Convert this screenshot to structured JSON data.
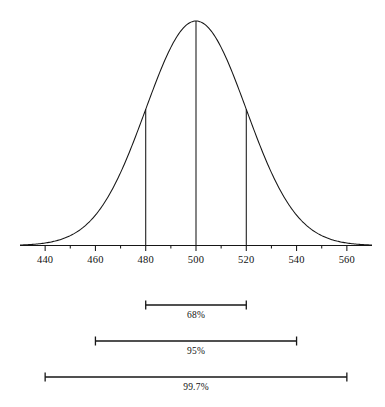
{
  "figure": {
    "name": "normal-distribution-empirical-rule",
    "caption_partial": ""
  },
  "chart_data": {
    "type": "line",
    "title": "",
    "subtitle": "",
    "xlabel": "",
    "ylabel": "",
    "grid": false,
    "legend": null,
    "xlim": [
      430,
      570
    ],
    "x_tick_labels": [
      "440",
      "460",
      "480",
      "500",
      "520",
      "540",
      "560"
    ],
    "x_tick_values": [
      440,
      460,
      480,
      500,
      520,
      540,
      560
    ],
    "minor_tick_step": 10,
    "distribution": {
      "shape": "normal",
      "mean": 500,
      "std_dev": 20,
      "peak_x": 500
    },
    "vertical_markers": [
      {
        "x": 480,
        "label": "480",
        "height_fraction": 0.6065
      },
      {
        "x": 500,
        "label": "500",
        "height_fraction": 1.0
      },
      {
        "x": 520,
        "label": "520",
        "height_fraction": 0.6065
      }
    ],
    "series": [
      {
        "name": "normal density",
        "x": [
          430,
          435,
          440,
          445,
          450,
          455,
          460,
          465,
          470,
          475,
          480,
          485,
          490,
          495,
          500,
          505,
          510,
          515,
          520,
          525,
          530,
          535,
          540,
          545,
          550,
          555,
          560,
          565,
          570
        ],
        "y": [
          0.0003,
          0.0009,
          0.0022,
          0.0051,
          0.0111,
          0.0228,
          0.0439,
          0.0796,
          0.1353,
          0.2163,
          0.3247,
          0.4578,
          0.6065,
          0.7548,
          1.0,
          0.7548,
          0.6065,
          0.4578,
          0.3247,
          0.2163,
          0.1353,
          0.0796,
          0.0439,
          0.0228,
          0.0111,
          0.0051,
          0.0022,
          0.0009,
          0.0003
        ]
      }
    ],
    "intervals": [
      {
        "label": "68%",
        "from": 480,
        "to": 520,
        "sigma": 1
      },
      {
        "label": "95%",
        "from": 460,
        "to": 540,
        "sigma": 2
      },
      {
        "label": "99.7%",
        "from": 440,
        "to": 560,
        "sigma": 3
      }
    ],
    "colors": {
      "curve": "#161616",
      "axis": "#161616",
      "interval_bar": "#161616",
      "background": "#ffffff",
      "text": "#111111"
    }
  }
}
